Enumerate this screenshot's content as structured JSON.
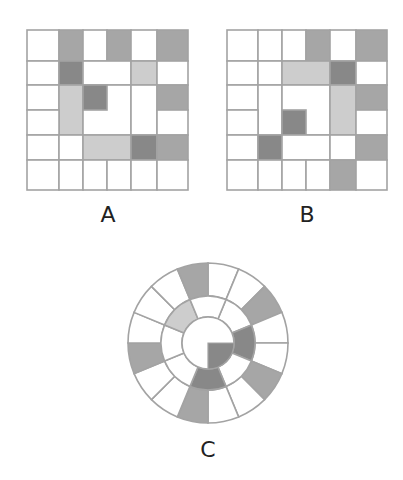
{
  "colors": {
    "border": "#a3a3a3",
    "white": "#ffffff",
    "light": "#cdcdcd",
    "medium": "#a6a6a6",
    "dark": "#888888"
  },
  "labels": {
    "a": "A",
    "b": "B",
    "c": "C"
  },
  "grid_a": {
    "cols": [
      27,
      59,
      83,
      107,
      131,
      157,
      188
    ],
    "rows": [
      30,
      61,
      85,
      110,
      135,
      160,
      190
    ],
    "cells": [
      {
        "c": 0,
        "r": 0,
        "cs": 1,
        "rs": 1,
        "fill": "white"
      },
      {
        "c": 1,
        "r": 0,
        "cs": 1,
        "rs": 1,
        "fill": "medium"
      },
      {
        "c": 2,
        "r": 0,
        "cs": 1,
        "rs": 1,
        "fill": "white"
      },
      {
        "c": 3,
        "r": 0,
        "cs": 1,
        "rs": 1,
        "fill": "medium"
      },
      {
        "c": 4,
        "r": 0,
        "cs": 1,
        "rs": 1,
        "fill": "white"
      },
      {
        "c": 5,
        "r": 0,
        "cs": 1,
        "rs": 1,
        "fill": "medium"
      },
      {
        "c": 0,
        "r": 1,
        "cs": 1,
        "rs": 1,
        "fill": "white"
      },
      {
        "c": 1,
        "r": 1,
        "cs": 1,
        "rs": 1,
        "fill": "dark"
      },
      {
        "c": 2,
        "r": 1,
        "cs": 2,
        "rs": 1,
        "fill": "white"
      },
      {
        "c": 4,
        "r": 1,
        "cs": 1,
        "rs": 1,
        "fill": "light"
      },
      {
        "c": 5,
        "r": 1,
        "cs": 1,
        "rs": 1,
        "fill": "white"
      },
      {
        "c": 0,
        "r": 2,
        "cs": 1,
        "rs": 1,
        "fill": "white"
      },
      {
        "c": 1,
        "r": 2,
        "cs": 1,
        "rs": 2,
        "fill": "light"
      },
      {
        "c": 2,
        "r": 2,
        "cs": 2,
        "rs": 2,
        "fill": "white"
      },
      {
        "c": 2,
        "r": 2,
        "cs": 1,
        "rs": 1,
        "fill": "dark"
      },
      {
        "c": 4,
        "r": 2,
        "cs": 1,
        "rs": 2,
        "fill": "white"
      },
      {
        "c": 5,
        "r": 2,
        "cs": 1,
        "rs": 1,
        "fill": "medium"
      },
      {
        "c": 0,
        "r": 3,
        "cs": 1,
        "rs": 1,
        "fill": "white"
      },
      {
        "c": 5,
        "r": 3,
        "cs": 1,
        "rs": 1,
        "fill": "white"
      },
      {
        "c": 0,
        "r": 4,
        "cs": 1,
        "rs": 1,
        "fill": "white"
      },
      {
        "c": 1,
        "r": 4,
        "cs": 1,
        "rs": 1,
        "fill": "white"
      },
      {
        "c": 2,
        "r": 4,
        "cs": 2,
        "rs": 1,
        "fill": "light"
      },
      {
        "c": 4,
        "r": 4,
        "cs": 1,
        "rs": 1,
        "fill": "dark"
      },
      {
        "c": 5,
        "r": 4,
        "cs": 1,
        "rs": 1,
        "fill": "medium"
      },
      {
        "c": 0,
        "r": 5,
        "cs": 1,
        "rs": 1,
        "fill": "white"
      },
      {
        "c": 1,
        "r": 5,
        "cs": 1,
        "rs": 1,
        "fill": "white"
      },
      {
        "c": 2,
        "r": 5,
        "cs": 1,
        "rs": 1,
        "fill": "white"
      },
      {
        "c": 3,
        "r": 5,
        "cs": 1,
        "rs": 1,
        "fill": "white"
      },
      {
        "c": 4,
        "r": 5,
        "cs": 1,
        "rs": 1,
        "fill": "white"
      },
      {
        "c": 5,
        "r": 5,
        "cs": 1,
        "rs": 1,
        "fill": "white"
      }
    ]
  },
  "grid_b": {
    "cols": [
      227,
      258,
      282,
      306,
      330,
      356,
      387
    ],
    "rows": [
      30,
      61,
      85,
      110,
      135,
      160,
      190
    ],
    "cells": [
      {
        "c": 0,
        "r": 0,
        "cs": 1,
        "rs": 1,
        "fill": "white"
      },
      {
        "c": 1,
        "r": 0,
        "cs": 1,
        "rs": 1,
        "fill": "white"
      },
      {
        "c": 2,
        "r": 0,
        "cs": 1,
        "rs": 1,
        "fill": "white"
      },
      {
        "c": 3,
        "r": 0,
        "cs": 1,
        "rs": 1,
        "fill": "medium"
      },
      {
        "c": 4,
        "r": 0,
        "cs": 1,
        "rs": 1,
        "fill": "white"
      },
      {
        "c": 5,
        "r": 0,
        "cs": 1,
        "rs": 1,
        "fill": "medium"
      },
      {
        "c": 0,
        "r": 1,
        "cs": 1,
        "rs": 1,
        "fill": "white"
      },
      {
        "c": 1,
        "r": 1,
        "cs": 1,
        "rs": 1,
        "fill": "white"
      },
      {
        "c": 2,
        "r": 1,
        "cs": 2,
        "rs": 1,
        "fill": "light"
      },
      {
        "c": 4,
        "r": 1,
        "cs": 1,
        "rs": 1,
        "fill": "dark"
      },
      {
        "c": 5,
        "r": 1,
        "cs": 1,
        "rs": 1,
        "fill": "white"
      },
      {
        "c": 0,
        "r": 2,
        "cs": 1,
        "rs": 1,
        "fill": "white"
      },
      {
        "c": 1,
        "r": 2,
        "cs": 1,
        "rs": 2,
        "fill": "white"
      },
      {
        "c": 2,
        "r": 2,
        "cs": 2,
        "rs": 2,
        "fill": "white"
      },
      {
        "c": 2,
        "r": 3,
        "cs": 1,
        "rs": 1,
        "fill": "dark"
      },
      {
        "c": 4,
        "r": 2,
        "cs": 1,
        "rs": 2,
        "fill": "light"
      },
      {
        "c": 5,
        "r": 2,
        "cs": 1,
        "rs": 1,
        "fill": "medium"
      },
      {
        "c": 0,
        "r": 3,
        "cs": 1,
        "rs": 1,
        "fill": "white"
      },
      {
        "c": 5,
        "r": 3,
        "cs": 1,
        "rs": 1,
        "fill": "white"
      },
      {
        "c": 0,
        "r": 4,
        "cs": 1,
        "rs": 1,
        "fill": "white"
      },
      {
        "c": 1,
        "r": 4,
        "cs": 1,
        "rs": 1,
        "fill": "dark"
      },
      {
        "c": 2,
        "r": 4,
        "cs": 2,
        "rs": 1,
        "fill": "white"
      },
      {
        "c": 4,
        "r": 4,
        "cs": 1,
        "rs": 1,
        "fill": "white"
      },
      {
        "c": 5,
        "r": 4,
        "cs": 1,
        "rs": 1,
        "fill": "medium"
      },
      {
        "c": 0,
        "r": 5,
        "cs": 1,
        "rs": 1,
        "fill": "white"
      },
      {
        "c": 1,
        "r": 5,
        "cs": 1,
        "rs": 1,
        "fill": "white"
      },
      {
        "c": 2,
        "r": 5,
        "cs": 1,
        "rs": 1,
        "fill": "white"
      },
      {
        "c": 3,
        "r": 5,
        "cs": 1,
        "rs": 1,
        "fill": "white"
      },
      {
        "c": 4,
        "r": 5,
        "cs": 1,
        "rs": 1,
        "fill": "medium"
      },
      {
        "c": 5,
        "r": 5,
        "cs": 1,
        "rs": 1,
        "fill": "white"
      }
    ]
  },
  "wheel_c": {
    "cx": 208,
    "cy": 343,
    "r_outer": 80,
    "r_mid": 47,
    "r_inner": 26,
    "outer_ring": {
      "segments": 16,
      "start_deg": 0,
      "shaded": [
        {
          "index": 15,
          "fill": "medium"
        },
        {
          "index": 2,
          "fill": "medium"
        },
        {
          "index": 5,
          "fill": "medium"
        },
        {
          "index": 8,
          "fill": "medium"
        },
        {
          "index": 11,
          "fill": "medium"
        }
      ]
    },
    "middle_ring": {
      "segments": 8,
      "start_deg": 22.5,
      "shaded": [
        {
          "index": 1,
          "fill": "dark"
        },
        {
          "index": 3,
          "fill": "dark"
        },
        {
          "index": 6,
          "fill": "light"
        }
      ]
    },
    "center": {
      "shaded_quadrant": {
        "from_deg": 90,
        "to_deg": 180,
        "fill": "dark"
      }
    }
  }
}
